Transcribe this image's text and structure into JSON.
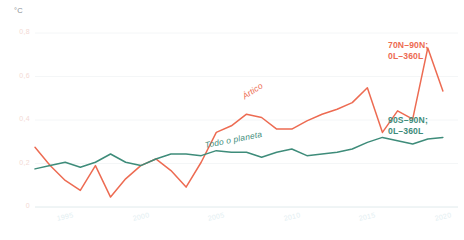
{
  "axes": {
    "y_unit": "°C",
    "y_ticks": [
      "0,8",
      "0,6",
      "0,4",
      "0,2",
      "0"
    ],
    "x_ticks": [
      "1995",
      "2000",
      "2005",
      "2010",
      "2015",
      "2020"
    ]
  },
  "legend": {
    "arctic": {
      "line1": "70N–90N;",
      "line2": "0L–360L",
      "color": "#ED6B52"
    },
    "global": {
      "line1": "90S–90N;",
      "line2": "0L–360L",
      "color": "#3E8C7A"
    }
  },
  "annotations": {
    "arctic_inline": "Ártico",
    "global_inline": "Todo o planeta"
  },
  "chart_data": {
    "type": "line",
    "title": "",
    "xlabel": "",
    "ylabel": "°C",
    "ylim": [
      -0.15,
      0.9
    ],
    "xlim": [
      1993,
      2021
    ],
    "grid": true,
    "legend_position": "right",
    "x": [
      1993,
      1994,
      1995,
      1996,
      1997,
      1998,
      1999,
      2000,
      2001,
      2002,
      2003,
      2004,
      2005,
      2006,
      2007,
      2008,
      2009,
      2010,
      2011,
      2012,
      2013,
      2014,
      2015,
      2016,
      2017,
      2018,
      2019,
      2020
    ],
    "series": [
      {
        "name": "Ártico",
        "label": "70N–90N; 0L–360L",
        "color": "#ED6B52",
        "values": [
          0.21,
          0.1,
          0.01,
          -0.05,
          0.1,
          -0.09,
          0.02,
          0.1,
          0.14,
          0.07,
          -0.03,
          0.12,
          0.3,
          0.34,
          0.41,
          0.39,
          0.32,
          0.32,
          0.37,
          0.41,
          0.44,
          0.48,
          0.57,
          0.3,
          0.43,
          0.38,
          0.81,
          0.55
        ]
      },
      {
        "name": "Todo o planeta",
        "label": "90S–90N; 0L–360L",
        "color": "#3E8C7A",
        "values": [
          0.08,
          0.1,
          0.12,
          0.09,
          0.12,
          0.17,
          0.12,
          0.1,
          0.14,
          0.17,
          0.17,
          0.16,
          0.19,
          0.18,
          0.18,
          0.15,
          0.18,
          0.2,
          0.16,
          0.17,
          0.18,
          0.2,
          0.24,
          0.27,
          0.25,
          0.23,
          0.26,
          0.27
        ]
      }
    ]
  }
}
